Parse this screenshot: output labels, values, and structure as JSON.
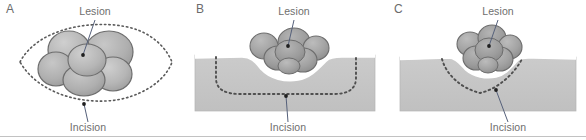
{
  "figure": {
    "panel_count": 3,
    "baseline_rule": true
  },
  "labels": {
    "lesion": "Lesion",
    "incision": "Incision"
  },
  "panels": [
    {
      "id": "A",
      "letter": "A",
      "view": "top-down surface view",
      "lesion_label": "Lesion",
      "incision_label": "Incision",
      "incision_shape": "elliptical / lens-shaped dotted outline around lesion",
      "lesion_shape": "multilobulated cluster of rounded lobes"
    },
    {
      "id": "B",
      "letter": "B",
      "view": "cross-section",
      "lesion_label": "Lesion",
      "incision_label": "Incision",
      "incision_shape": "wide rectangular / saucerized dotted outline beneath lesion",
      "lesion_shape": "multilobulated exophytic mass on skin surface"
    },
    {
      "id": "C",
      "letter": "C",
      "view": "cross-section",
      "lesion_label": "Lesion",
      "incision_label": "Incision",
      "incision_shape": "narrow V-shaped conical dotted outline beneath lesion",
      "lesion_shape": "multilobulated exophytic mass on skin surface"
    }
  ],
  "colors": {
    "background": "#ffffff",
    "tissue_fill": "#c6c6c6",
    "tissue_edge": "#b4b4b4",
    "skin_line": "#ffffff",
    "lesion_fill": "#a8a8a8",
    "lesion_fill_dark": "#9a9a9a",
    "lesion_stroke": "#6d6d6d",
    "dotted_incision": "#5a5a5a",
    "text": "#6e6e6e",
    "leader_line": "#55607a",
    "baseline_rule": "#c2c2c2"
  }
}
